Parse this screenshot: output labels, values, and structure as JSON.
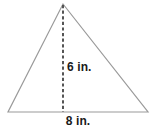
{
  "figure": {
    "type": "triangle-with-height",
    "background_color": "#ffffff",
    "outline_color": "#9a9a9a",
    "dash_color": "#555555",
    "text_color": "#1a1a1a",
    "labels": {
      "height": "6 in.",
      "base": "8 in."
    },
    "measurements": {
      "height_value": 6,
      "height_unit": "in.",
      "base_value": 8,
      "base_unit": "in."
    },
    "geometry": {
      "apex": [
        63,
        4
      ],
      "left_vertex": [
        8,
        112
      ],
      "right_vertex": [
        148,
        112
      ],
      "height_foot": [
        63,
        112
      ]
    }
  }
}
